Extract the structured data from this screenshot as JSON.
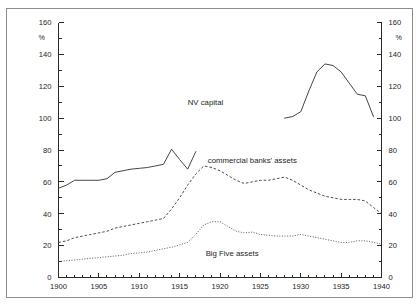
{
  "chart_data": {
    "type": "line",
    "title": "",
    "subtitle": "",
    "xlabel": "",
    "ylabel": "%",
    "ylabel_right": "%",
    "xlim": [
      1900,
      1940
    ],
    "ylim": [
      0,
      160
    ],
    "grid": false,
    "legend_position": "inline-annotations",
    "x_ticks": [
      1900,
      1905,
      1910,
      1915,
      1920,
      1925,
      1930,
      1935,
      1940
    ],
    "x_tick_labels": [
      "1900",
      "1905",
      "1910",
      "1915",
      "1920",
      "1925",
      "1930",
      "1935",
      "1940"
    ],
    "x_minor_step": 1,
    "y_ticks": [
      0,
      20,
      40,
      60,
      80,
      100,
      120,
      140,
      160
    ],
    "y_tick_labels": [
      "0",
      "20",
      "40",
      "60",
      "80",
      "100",
      "120",
      "140",
      "160"
    ],
    "y_minor_step": 10,
    "annotations": [
      {
        "text": "NV capital",
        "x": 1918.2,
        "y": 108
      },
      {
        "text": "commercial banks' assets",
        "x": 1924.0,
        "y": 72
      },
      {
        "text": "Big Five assets",
        "x": 1921.5,
        "y": 13.5
      }
    ],
    "series": [
      {
        "name": "NV capital",
        "style": "solid",
        "color": "#30302f",
        "x": [
          1928,
          1929,
          1930,
          1931,
          1932,
          1933,
          1934,
          1935,
          1936,
          1937,
          1938,
          1939
        ],
        "values": [
          100,
          101,
          104,
          117,
          129,
          134,
          133,
          129,
          122,
          115,
          114,
          101
        ]
      },
      {
        "name": "commercial banks' assets",
        "style": "dashed",
        "color": "#3a3a3a",
        "x": [
          1900,
          1901,
          1902,
          1903,
          1904,
          1905,
          1906,
          1907,
          1908,
          1909,
          1910,
          1911,
          1912,
          1913,
          1914,
          1915,
          1916,
          1917,
          1918,
          1919,
          1920,
          1921,
          1922,
          1923,
          1924,
          1925,
          1926,
          1927,
          1928,
          1929,
          1930,
          1931,
          1932,
          1933,
          1934,
          1935,
          1936,
          1937,
          1938,
          1939,
          1940
        ],
        "values": [
          22,
          23,
          25,
          26,
          27,
          28,
          29,
          31,
          32,
          33,
          34,
          35,
          36,
          37,
          43,
          50,
          58,
          65,
          70,
          69,
          67,
          64,
          61,
          59,
          60,
          61,
          61,
          62,
          63,
          61,
          58,
          55,
          53,
          51,
          50,
          49,
          49,
          49,
          48,
          44,
          40
        ]
      },
      {
        "name": "Big Five assets",
        "style": "dotted",
        "color": "#565656",
        "x": [
          1900,
          1901,
          1902,
          1903,
          1904,
          1905,
          1906,
          1907,
          1908,
          1909,
          1910,
          1911,
          1912,
          1913,
          1914,
          1915,
          1916,
          1917,
          1918,
          1919,
          1920,
          1921,
          1922,
          1923,
          1924,
          1925,
          1926,
          1927,
          1928,
          1929,
          1930,
          1931,
          1932,
          1933,
          1934,
          1935,
          1936,
          1937,
          1938,
          1939,
          1940
        ],
        "values": [
          10,
          10.5,
          11,
          11.5,
          12,
          12.5,
          13,
          13.5,
          14,
          15,
          15.5,
          16,
          17,
          18,
          19,
          20.5,
          22,
          27,
          33,
          35,
          35,
          32,
          29,
          28,
          28.5,
          27,
          26.5,
          26,
          26,
          26,
          27,
          26,
          25,
          24,
          23,
          22,
          22,
          23,
          23,
          22,
          21
        ]
      },
      {
        "name": "pre-war capital segment",
        "style": "solid",
        "color": "#30302f",
        "x": [
          1900,
          1901,
          1902,
          1903,
          1904,
          1905,
          1906,
          1907,
          1908,
          1909,
          1910,
          1911,
          1912,
          1913,
          1914,
          1915,
          1916,
          1917
        ],
        "values": [
          56,
          58,
          61,
          61,
          61,
          61,
          62,
          66,
          67,
          68,
          68.5,
          69,
          70,
          71,
          80.5,
          74,
          68,
          79
        ]
      }
    ]
  }
}
